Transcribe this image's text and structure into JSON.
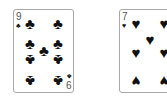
{
  "cards": [
    {
      "rank": "9",
      "rank_bottom": "6",
      "suit": "clubs",
      "suit_glyph": "♣",
      "color": "#111111"
    },
    {
      "rank": "7",
      "suit": "hearts",
      "suit_glyph": "♥",
      "color": "#111111"
    }
  ]
}
